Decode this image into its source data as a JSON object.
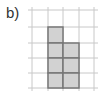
{
  "label": "b)",
  "grid": {
    "x_lines": [
      32,
      48,
      63,
      79,
      94
    ],
    "y_lines": [
      10,
      27,
      43,
      58,
      73,
      88
    ],
    "line_color": "#c8c8c8"
  },
  "shaded_cells": [
    {
      "col": 1,
      "row": 1
    },
    {
      "col": 1,
      "row": 2
    },
    {
      "col": 2,
      "row": 2
    },
    {
      "col": 1,
      "row": 3
    },
    {
      "col": 2,
      "row": 3
    },
    {
      "col": 1,
      "row": 4
    },
    {
      "col": 2,
      "row": 4
    }
  ],
  "colors": {
    "fill": "#d2d2d2",
    "stroke": "#777777"
  }
}
